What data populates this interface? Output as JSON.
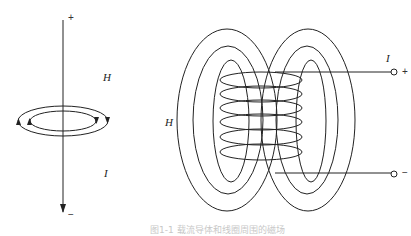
{
  "left_panel": {
    "title": "straight-conductor-field",
    "labels": {
      "field": "H",
      "current": "I",
      "plus": "+",
      "minus": "−"
    },
    "field_loops": 2,
    "arrow_directions": [
      "up-left",
      "down-right"
    ]
  },
  "right_panel": {
    "title": "solenoid-field",
    "labels": {
      "field": "H",
      "current": "I",
      "plus": "+",
      "minus": "−"
    },
    "coil_turns": 6,
    "field_loops_per_side": 3,
    "terminals": [
      "+",
      "−"
    ]
  },
  "caption": "图1-1 载流导体和线圈周围的磁场",
  "colors": {
    "line": "#222222",
    "background": "#ffffff",
    "caption": "#c8c8c8"
  }
}
